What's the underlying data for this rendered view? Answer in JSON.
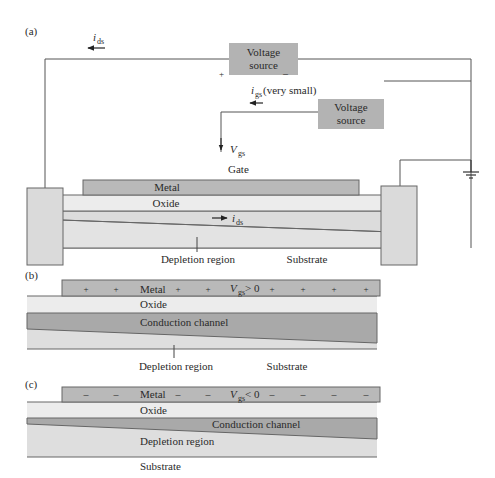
{
  "colors": {
    "metal": "#b9b9b9",
    "oxide": "#ececec",
    "substrate": "#dcdcdc",
    "channel": "#a9a9a9",
    "source_box": "#b3b3b3",
    "line": "#555555"
  },
  "panel_a": {
    "label": "(a)",
    "ids_top": {
      "i": "i",
      "sub": "ds"
    },
    "voltage_source_1": {
      "line1": "Voltage",
      "line2": "source",
      "plus": "+",
      "minus": "–"
    },
    "igs": {
      "i": "i",
      "sub": "gs",
      "note": " (very small)"
    },
    "voltage_source_2": {
      "line1": "Voltage",
      "line2": "source"
    },
    "vgs": {
      "v": "V",
      "sub": "gs"
    },
    "gate_label": "Gate",
    "metal_label": "Metal",
    "oxide_label": "Oxide",
    "ids_channel": {
      "i": "i",
      "sub": "ds"
    },
    "depletion_label": "Depletion region",
    "substrate_label": "Substrate",
    "ground_icon": "ground-symbol"
  },
  "panel_b": {
    "label": "(b)",
    "metal_label": "Metal",
    "charge_sign": "+",
    "vgs_condition": {
      "v": "V",
      "sub": "gs",
      "rel": " > 0"
    },
    "oxide_label": "Oxide",
    "channel_label": "Conduction channel",
    "depletion_label": "Depletion region",
    "substrate_label": "Substrate"
  },
  "panel_c": {
    "label": "(c)",
    "metal_label": "Metal",
    "charge_sign": "–",
    "vgs_condition": {
      "v": "V",
      "sub": "gs",
      "rel": " < 0"
    },
    "oxide_label": "Oxide",
    "channel_label": "Conduction channel",
    "depletion_label": "Depletion region",
    "substrate_label": "Substrate"
  }
}
